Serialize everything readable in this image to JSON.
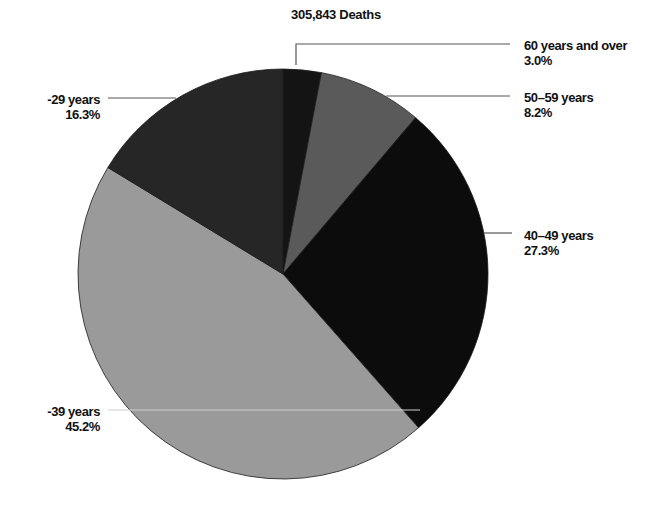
{
  "chart_data": {
    "type": "pie",
    "title": "305,843 Deaths",
    "categories": [
      "60 years and over",
      "50–59 years",
      "40–49 years",
      "30–39 years",
      "20–29 years"
    ],
    "visible_labels": [
      "60 years and over",
      "50–59 years",
      "40–49 years",
      "-39 years",
      "-29 years"
    ],
    "values": [
      3.0,
      8.2,
      27.3,
      45.2,
      16.3
    ],
    "value_labels": [
      "3.0%",
      "8.2%",
      "27.3%",
      "45.2%",
      "16.3%"
    ],
    "colors": [
      "#141414",
      "#5a5a5a",
      "#0c0c0c",
      "#9a9a9a",
      "#262626"
    ],
    "start_angle_deg": 0,
    "direction": "clockwise",
    "legend": "none (leader-line labels)",
    "grid": false
  },
  "labels": {
    "title": "305,843 Deaths",
    "s60": {
      "name": "60 years and over",
      "pct": "3.0%"
    },
    "s50": {
      "name": "50–59 years",
      "pct": "8.2%"
    },
    "s40": {
      "name": "40–49 years",
      "pct": "27.3%"
    },
    "s30": {
      "name": "-39 years",
      "pct": "45.2%"
    },
    "s20": {
      "name": "-29 years",
      "pct": "16.3%"
    }
  }
}
